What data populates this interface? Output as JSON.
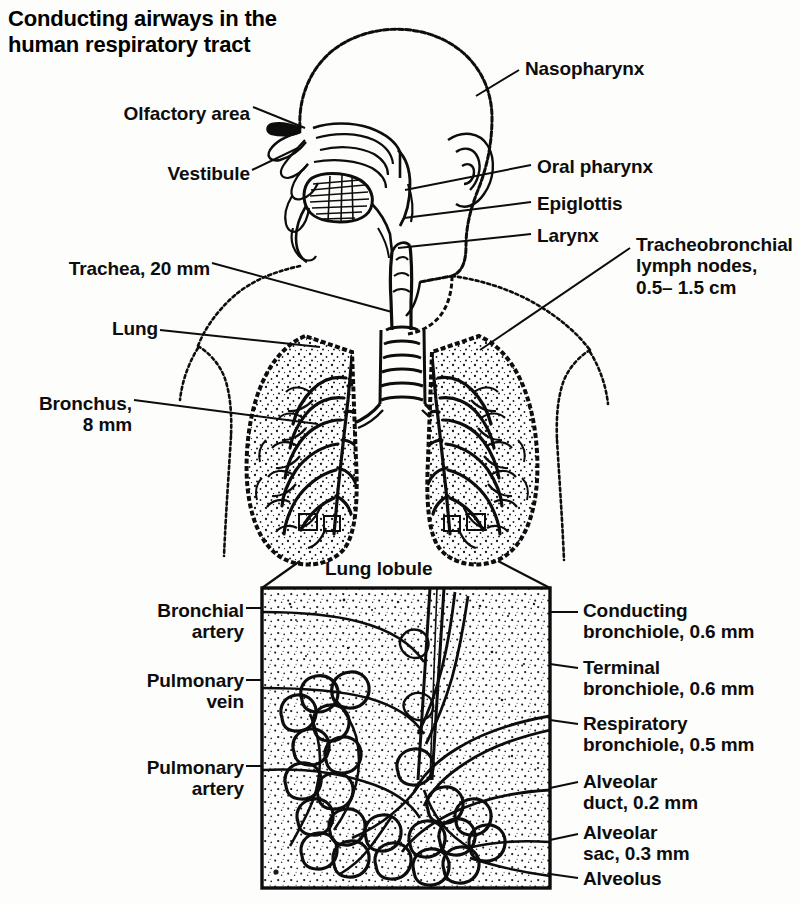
{
  "figure": {
    "title": "Conducting airways in the\nhuman respiratory tract",
    "caption_lung_lobule": "Lung lobule",
    "ink_color": "#0d0d0d",
    "background_color": "#fdfdfb"
  },
  "labels_left": [
    {
      "id": "olfactory-area",
      "text": "Olfactory area",
      "x": 118,
      "y": 103
    },
    {
      "id": "vestibule",
      "text": "Vestibule",
      "x": 160,
      "y": 163
    },
    {
      "id": "trachea",
      "text": "Trachea, 20 mm",
      "x": 66,
      "y": 258
    },
    {
      "id": "lung",
      "text": "Lung",
      "x": 108,
      "y": 325
    },
    {
      "id": "bronchus",
      "text": "Bronchus,\n8 mm",
      "x": 37,
      "y": 393
    },
    {
      "id": "bronchial-artery",
      "text": "Bronchial\nartery",
      "x": 152,
      "y": 600
    },
    {
      "id": "pulmonary-vein",
      "text": "Pulmonary\nvein",
      "x": 137,
      "y": 670
    },
    {
      "id": "pulmonary-artery",
      "text": "Pulmonary\nartery",
      "x": 137,
      "y": 757
    }
  ],
  "labels_right": [
    {
      "id": "nasopharynx",
      "text": "Nasopharynx",
      "x": 525,
      "y": 58
    },
    {
      "id": "oral-pharynx",
      "text": "Oral pharynx",
      "x": 537,
      "y": 158
    },
    {
      "id": "epiglottis",
      "text": "Epiglottis",
      "x": 537,
      "y": 195
    },
    {
      "id": "larynx",
      "text": "Larynx",
      "x": 537,
      "y": 227
    },
    {
      "id": "tracheobronchial-lymph-nodes",
      "text": "Tracheobronchial\nlymph nodes,\n0.5– 1.5 cm",
      "x": 636,
      "y": 234
    },
    {
      "id": "conducting-bronchiole",
      "text": "Conducting\nbronchiole, 0.6 mm",
      "x": 583,
      "y": 600
    },
    {
      "id": "terminal-bronchiole",
      "text": "Terminal\nbronchiole, 0.6 mm",
      "x": 583,
      "y": 657
    },
    {
      "id": "respiratory-bronchiole",
      "text": "Respiratory\nbronchiole, 0.5 mm",
      "x": 583,
      "y": 713
    },
    {
      "id": "alveolar-duct",
      "text": "Alveolar\nduct, 0.2 mm",
      "x": 583,
      "y": 771
    },
    {
      "id": "alveolar-sac",
      "text": "Alveolar\nsac, 0.3 mm",
      "x": 583,
      "y": 822
    },
    {
      "id": "alveolus",
      "text": "Alveolus",
      "x": 583,
      "y": 871
    }
  ],
  "structures": [
    {
      "id": "head-sagittal-section",
      "name": "Head sagittal section"
    },
    {
      "id": "nasal-cavity",
      "name": "Nasal cavity"
    },
    {
      "id": "tongue",
      "name": "Tongue"
    },
    {
      "id": "ear",
      "name": "Ear"
    },
    {
      "id": "trachea-rings",
      "name": "Trachea with cartilage rings"
    },
    {
      "id": "left-lung",
      "name": "Left lung with bronchial tree"
    },
    {
      "id": "right-lung",
      "name": "Right lung with bronchial tree"
    },
    {
      "id": "torso-outline",
      "name": "Torso outline"
    },
    {
      "id": "lung-lobule-panel",
      "name": "Lung lobule detail panel"
    },
    {
      "id": "alveolar-clusters",
      "name": "Alveolar clusters"
    }
  ]
}
